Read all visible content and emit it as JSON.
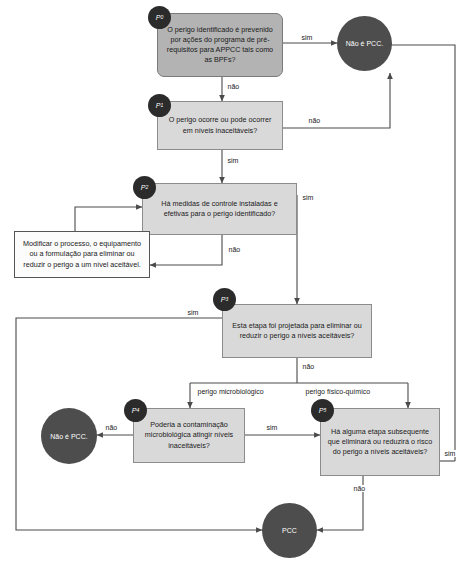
{
  "diagram": {
    "title_fragment": "",
    "decisions": [
      {
        "id": "P0",
        "badge": "P",
        "badge_sub": "0",
        "text": "O perigo identificado é prevenido por ações do programa de pré-requisitos para APPCC tais como as BPFs?"
      },
      {
        "id": "P1",
        "badge": "P",
        "badge_sub": "1",
        "text": "O perigo ocorre ou pode ocorrer em níveis inaceitáveis?"
      },
      {
        "id": "P2",
        "badge": "P",
        "badge_sub": "2",
        "text": "Há medidas de controle instaladas e efetivas para o perigo identificado?"
      },
      {
        "id": "P3",
        "badge": "P",
        "badge_sub": "3",
        "text": "Esta etapa foi projetada para eliminar ou reduzir o perigo a níveis aceitáveis?"
      },
      {
        "id": "P4",
        "badge": "P",
        "badge_sub": "4",
        "text": "Poderia a contaminação microbiológica atingir níveis inaceitáveis?"
      },
      {
        "id": "P5",
        "badge": "P",
        "badge_sub": "5",
        "text": "Há alguma etapa subsequente que eliminará ou reduzirá o risco do perigo a níveis aceitáveis?"
      }
    ],
    "action_box": {
      "text": "Modificar o processo, o equipamento ou a formulação para eliminar ou reduzir o perigo a um nível aceitável."
    },
    "terminals": [
      {
        "id": "nao-pcc-top",
        "text": "Não é PCC."
      },
      {
        "id": "nao-pcc-left",
        "text": "Não é PCC."
      },
      {
        "id": "pcc",
        "text": "PCC"
      }
    ],
    "edge_labels": {
      "p0_yes": "sim",
      "p0_no": "não",
      "p1_no": "não",
      "p1_yes": "sim",
      "p2_yes": "sim",
      "p2_no": "não",
      "p3_yes": "sim",
      "p3_no": "não",
      "branch_micro": "perigo microbiológico",
      "branch_fisico": "perigo físico-químico",
      "p4_no": "não",
      "p4_yes": "sim",
      "p5_yes": "sim",
      "p5_no": "não"
    },
    "colors": {
      "box_fill": "#d9d9d9",
      "rounded_fill": "#b3b3b3",
      "circle_fill": "#4d4d4d",
      "badge_fill": "#2b2b2b",
      "line": "#4a4a4a",
      "text": "#1a1a1a"
    }
  }
}
